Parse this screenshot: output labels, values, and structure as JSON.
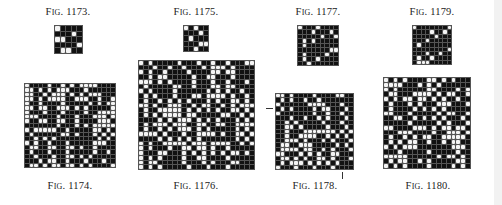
{
  "figures": [
    {
      "id": "fig-1173",
      "caption": "Fig. 1173.",
      "pos": "top",
      "x": 54,
      "y": 25,
      "w": 29,
      "h": 29,
      "cols": 5,
      "rows": 5,
      "seed": 1173,
      "density": 0.15
    },
    {
      "id": "fig-1174",
      "caption": "Fig. 1174.",
      "pos": "bottom",
      "x": 24,
      "y": 83,
      "w": 92,
      "h": 85,
      "cols": 20,
      "rows": 19,
      "seed": 1174,
      "density": 0.6
    },
    {
      "id": "fig-1175",
      "caption": "Fig. 1175.",
      "pos": "top",
      "x": 183,
      "y": 25,
      "w": 26,
      "h": 27,
      "cols": 5,
      "rows": 5,
      "seed": 1175,
      "density": 0.2
    },
    {
      "id": "fig-1176",
      "caption": "Fig. 1176.",
      "pos": "bottom",
      "x": 138,
      "y": 60,
      "w": 117,
      "h": 110,
      "cols": 24,
      "rows": 23,
      "seed": 1176,
      "density": 0.65
    },
    {
      "id": "fig-1177",
      "caption": "Fig. 1177.",
      "pos": "top",
      "x": 297,
      "y": 25,
      "w": 42,
      "h": 41,
      "cols": 9,
      "rows": 9,
      "seed": 1177,
      "density": 0.2
    },
    {
      "id": "fig-1178",
      "caption": "Fig. 1178.",
      "pos": "bottom",
      "x": 275,
      "y": 93,
      "w": 79,
      "h": 77,
      "cols": 17,
      "rows": 17,
      "seed": 1178,
      "density": 0.55
    },
    {
      "id": "fig-1179",
      "caption": "Fig. 1179.",
      "pos": "top",
      "x": 412,
      "y": 25,
      "w": 40,
      "h": 40,
      "cols": 9,
      "rows": 9,
      "seed": 1179,
      "density": 0.2
    },
    {
      "id": "fig-1180",
      "caption": "Fig. 1180.",
      "pos": "bottom",
      "x": 383,
      "y": 77,
      "w": 88,
      "h": 92,
      "cols": 18,
      "rows": 19,
      "seed": 1180,
      "density": 0.7
    }
  ],
  "captions": {
    "fig_1173": "Fig. 1173.",
    "fig_1174": "Fig. 1174.",
    "fig_1175": "Fig. 1175.",
    "fig_1176": "Fig. 1176.",
    "fig_1177": "Fig. 1177.",
    "fig_1178": "Fig. 1178.",
    "fig_1179": "Fig. 1179.",
    "fig_1180": "Fig. 1180."
  }
}
